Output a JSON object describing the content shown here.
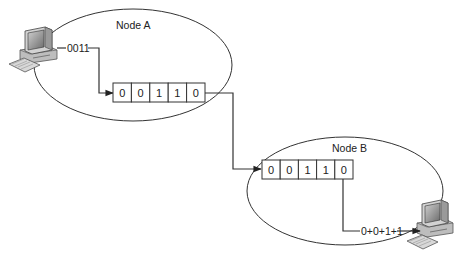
{
  "diagram": {
    "node_a": {
      "label": "Node A",
      "input_bits": "0011",
      "register": [
        "0",
        "0",
        "1",
        "1",
        "0"
      ]
    },
    "node_b": {
      "label": "Node B",
      "register": [
        "0",
        "0",
        "1",
        "1",
        "0"
      ],
      "output_sum": "0+0+1+1"
    },
    "icons": {
      "computer_a": "desktop-computer",
      "computer_b": "desktop-computer"
    },
    "colors": {
      "line": "#333333",
      "monitor_screen": "#8a8a8a",
      "computer_body": "#c8c8c8"
    }
  }
}
